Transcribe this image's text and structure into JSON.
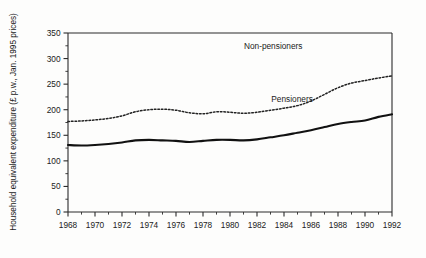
{
  "chart_data": {
    "type": "line",
    "title": "",
    "xlabel": "",
    "ylabel": "Household equivalent expenditure (£ p.w., Jan. 1995 prices)",
    "xlim": [
      1968,
      1992
    ],
    "ylim": [
      0,
      350
    ],
    "grid": false,
    "legend_position": "inline-annotations",
    "x_tick_labels": [
      "1968",
      "1970",
      "1972",
      "1974",
      "1976",
      "1978",
      "1980",
      "1982",
      "1984",
      "1986",
      "1988",
      "1990",
      "1992"
    ],
    "x_tick_values": [
      1968,
      1970,
      1972,
      1974,
      1976,
      1978,
      1980,
      1982,
      1984,
      1986,
      1988,
      1990,
      1992
    ],
    "x_minor_tick_values": [
      1969,
      1971,
      1973,
      1975,
      1977,
      1979,
      1981,
      1983,
      1985,
      1987,
      1989,
      1991
    ],
    "y_tick_labels": [
      "0",
      "50",
      "100",
      "150",
      "200",
      "250",
      "300",
      "350"
    ],
    "y_tick_values": [
      0,
      50,
      100,
      150,
      200,
      250,
      300,
      350
    ],
    "y_minor_tick_values": [
      25,
      75,
      125,
      175,
      225,
      275,
      325
    ],
    "x": [
      1968,
      1969,
      1970,
      1971,
      1972,
      1973,
      1974,
      1975,
      1976,
      1977,
      1978,
      1979,
      1980,
      1981,
      1982,
      1983,
      1984,
      1985,
      1986,
      1987,
      1988,
      1989,
      1990,
      1991,
      1992
    ],
    "series": [
      {
        "name": "Non-pensioners",
        "style": "dotted",
        "color": "#222222",
        "label_x": 1983.2,
        "label_y": 318,
        "values": [
          177,
          178,
          180,
          183,
          188,
          196,
          200,
          201,
          199,
          194,
          192,
          196,
          195,
          193,
          195,
          199,
          203,
          208,
          217,
          230,
          243,
          252,
          257,
          262,
          266
        ]
      },
      {
        "name": "Pensioners",
        "style": "solid",
        "color": "#111111",
        "label_x": 1984.6,
        "label_y": 216,
        "values": [
          131,
          130,
          131,
          133,
          136,
          140,
          141,
          140,
          139,
          137,
          139,
          141,
          141,
          140,
          142,
          146,
          150,
          155,
          160,
          166,
          172,
          176,
          179,
          186,
          191
        ]
      }
    ]
  }
}
